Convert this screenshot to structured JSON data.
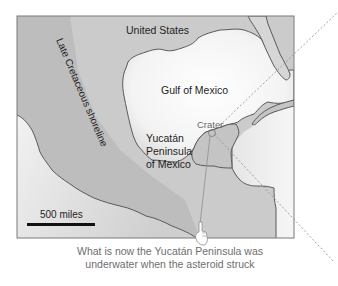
{
  "map": {
    "labels": {
      "country_north": "United States",
      "water_body": "Gulf of Mexico",
      "peninsula_line1": "Yucatán",
      "peninsula_line2": "Peninsula",
      "peninsula_line3": "of Mexico",
      "ancient_shoreline": "Late Cretaceous shoreline",
      "impact_site": "Crater"
    },
    "scale_bar": {
      "label": "500 miles"
    },
    "colors": {
      "land": "#bdbdbd",
      "ancient_sea": "#d2d2d2",
      "water": "#f4f4f4",
      "coastline": "#5a5a5a",
      "trajectory": "#8a8a8a",
      "frame": "#7a7a7a"
    }
  },
  "caption": {
    "line1": "What is now the Yucatán Peninsula was",
    "line2": "underwater when the asteroid struck"
  }
}
